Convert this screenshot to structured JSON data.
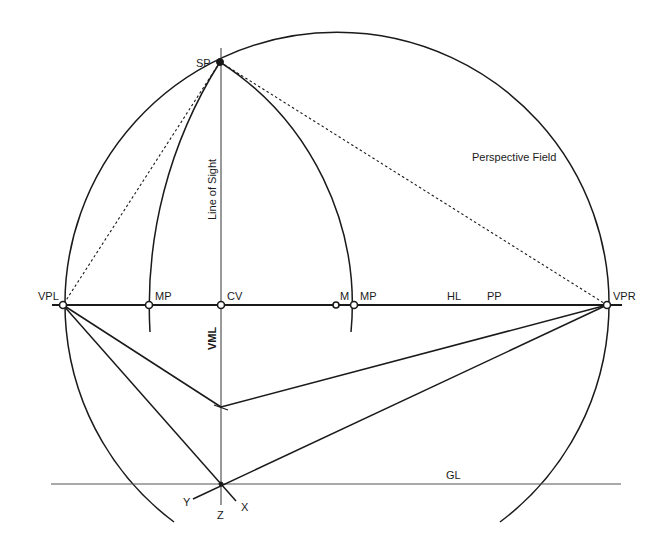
{
  "diagram": {
    "labels": {
      "sp": "SP",
      "vpl": "VPL",
      "vpr": "VPR",
      "mp_left": "MP",
      "mp_right": "MP",
      "cv": "CV",
      "m": "M",
      "hl": "HL",
      "pp": "PP",
      "gl": "GL",
      "vml": "VML",
      "line_of_sight": "Line of Sight",
      "perspective_field": "Perspective Field",
      "axis_x": "X",
      "axis_y": "Y",
      "axis_z": "Z"
    },
    "points": {
      "SP": [
        220,
        62
      ],
      "VPL": [
        63,
        305
      ],
      "VPR": [
        607,
        305
      ],
      "MP_left": [
        149,
        305
      ],
      "CV": [
        221,
        305
      ],
      "M": [
        336,
        305
      ],
      "MP_right": [
        354,
        305
      ],
      "VML_cross": [
        221,
        407
      ],
      "GL_origin": [
        221,
        484
      ]
    },
    "lines": {
      "horizon_line": {
        "from": [
          52,
          305
        ],
        "to": [
          622,
          305
        ]
      },
      "ground_line": {
        "from": [
          51,
          484
        ],
        "to": [
          621,
          484
        ]
      },
      "line_of_sight": {
        "from": [
          221,
          48
        ],
        "to": [
          221,
          505
        ]
      }
    },
    "perspective_field_circle": {
      "center": [
        335,
        308
      ],
      "radius": 272
    },
    "colors": {
      "ink": "#1a1a1a",
      "background": "#ffffff"
    }
  }
}
